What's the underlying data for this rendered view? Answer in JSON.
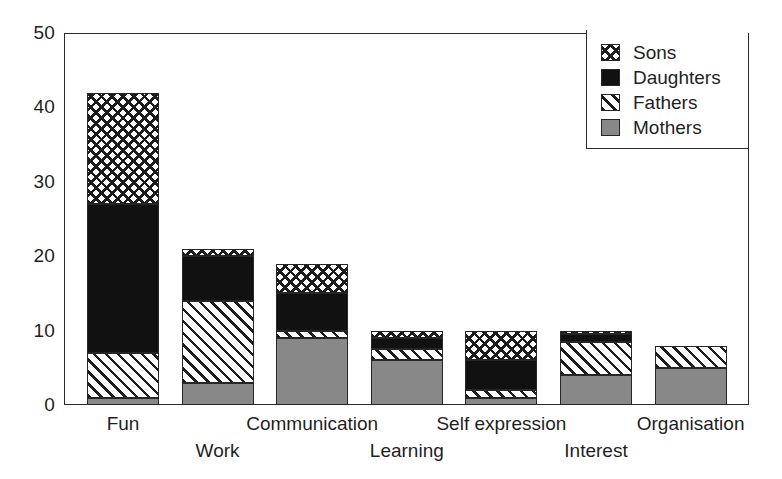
{
  "chart_data": {
    "type": "bar",
    "subtype": "stacked-vertical",
    "title": "",
    "subtitle": "",
    "xlabel": "",
    "ylabel": "",
    "ylim": [
      0,
      50
    ],
    "ytick_labels": [
      "0",
      "10",
      "20",
      "30",
      "40",
      "50"
    ],
    "ytick_values": [
      0,
      10,
      20,
      30,
      40,
      50
    ],
    "yminor_tick_values": [
      5,
      15,
      25,
      35,
      45
    ],
    "grid": false,
    "legend_position": "top-right",
    "categories": [
      "Fun",
      "Work",
      "Communication",
      "Learning",
      "Self expression",
      "Interest",
      "Organisation"
    ],
    "category_label_rows": [
      0,
      1,
      0,
      1,
      0,
      1,
      0
    ],
    "series": [
      {
        "name": "Mothers",
        "pattern": "solid-gray",
        "color": "#888888",
        "values": [
          1,
          3,
          9,
          6,
          1,
          4,
          5
        ]
      },
      {
        "name": "Fathers",
        "pattern": "diagonal-hatch",
        "color": "#ffffff",
        "values": [
          6,
          11,
          1,
          1.5,
          1,
          4.5,
          3
        ]
      },
      {
        "name": "Daughters",
        "pattern": "solid-black",
        "color": "#111111",
        "values": [
          20,
          6,
          5,
          1.5,
          4,
          1,
          0
        ]
      },
      {
        "name": "Sons",
        "pattern": "crosshatch",
        "color": "#ffffff",
        "values": [
          15,
          1,
          4,
          1,
          4,
          0.5,
          0
        ]
      }
    ],
    "stack_order_bottom_to_top": [
      "Mothers",
      "Fathers",
      "Daughters",
      "Sons"
    ],
    "stack_totals": [
      42,
      21,
      19,
      10,
      10,
      10,
      8
    ],
    "annotations": []
  },
  "legend": {
    "entries": [
      {
        "label": "Sons",
        "swatch": "crosshatch-swatch"
      },
      {
        "label": "Daughters",
        "swatch": "solid-black-swatch"
      },
      {
        "label": "Fathers",
        "swatch": "diagonal-hatch-swatch"
      },
      {
        "label": "Mothers",
        "swatch": "solid-gray-swatch"
      }
    ]
  }
}
